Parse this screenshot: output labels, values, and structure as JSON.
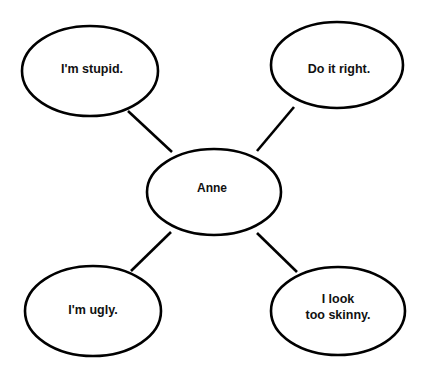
{
  "diagram": {
    "type": "cluster-map",
    "background_color": "#ffffff",
    "stroke_color": "#000000",
    "text_color": "#111111",
    "center": {
      "id": "center",
      "label": "Anne",
      "cx": 214,
      "cy": 192,
      "rx": 67,
      "ry": 43,
      "text_x": 212,
      "text_y": 189
    },
    "satellites": [
      {
        "id": "top-left",
        "label": "I'm stupid.",
        "lines": [
          "I'm stupid."
        ],
        "cx": 90,
        "cy": 71,
        "rx": 68,
        "ry": 45,
        "text_x": 92,
        "text_y": 70
      },
      {
        "id": "top-right",
        "label": "Do it right.",
        "lines": [
          "Do it right."
        ],
        "cx": 337,
        "cy": 65,
        "rx": 66,
        "ry": 43,
        "text_x": 339,
        "text_y": 70
      },
      {
        "id": "bottom-left",
        "label": "I'm ugly.",
        "lines": [
          "I'm ugly."
        ],
        "cx": 93,
        "cy": 311,
        "rx": 68,
        "ry": 45,
        "text_x": 93,
        "text_y": 311
      },
      {
        "id": "bottom-right",
        "label": "I look too skinny.",
        "lines": [
          "I look",
          "too skinny."
        ],
        "cx": 338,
        "cy": 311,
        "rx": 67,
        "ry": 44,
        "text_x": 338,
        "text_y": 300
      }
    ],
    "connectors": [
      {
        "id": "center-to-top-left",
        "x1": 128,
        "y1": 111,
        "x2": 172,
        "y2": 152
      },
      {
        "id": "center-to-top-right",
        "x1": 294,
        "y1": 107,
        "x2": 257,
        "y2": 151
      },
      {
        "id": "center-to-bottom-left",
        "x1": 171,
        "y1": 232,
        "x2": 131,
        "y2": 271
      },
      {
        "id": "center-to-bottom-right",
        "x1": 257,
        "y1": 233,
        "x2": 297,
        "y2": 272
      }
    ]
  }
}
